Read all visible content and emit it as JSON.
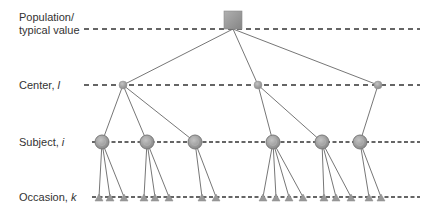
{
  "levels": [
    {
      "id": "population",
      "label": "Population/\ntypical value",
      "y": 29
    },
    {
      "id": "center",
      "label": "Center, l",
      "label_main": "Center, ",
      "label_var": "l",
      "y": 85
    },
    {
      "id": "subject",
      "label": "Subject, i",
      "label_main": "Subject, ",
      "label_var": "i",
      "y": 142
    },
    {
      "id": "occasion",
      "label": "Occasion, k",
      "label_main": "Occasion, ",
      "label_var": "k",
      "y": 197
    }
  ],
  "colors": {
    "node_fill": "#9a9a9a",
    "node_stroke": "#7a7a7a",
    "edge": "#666666",
    "dash": "#333333",
    "text": "#333333"
  },
  "tree": {
    "population": {
      "x": 233,
      "y": 20
    },
    "centers": [
      {
        "x": 123,
        "y": 85,
        "subjects": [
          {
            "x": 102,
            "occasions": [
              99,
              110,
              124
            ]
          },
          {
            "x": 147,
            "occasions": [
              144,
              155,
              169
            ]
          },
          {
            "x": 195,
            "occasions": [
              202,
              216
            ]
          }
        ]
      },
      {
        "x": 258,
        "y": 85,
        "subjects": [
          {
            "x": 273,
            "occasions": [
              263,
              276,
              289,
              303
            ]
          },
          {
            "x": 322,
            "occasions": [
              324,
              336,
              351
            ]
          }
        ]
      },
      {
        "x": 378,
        "y": 85,
        "subjects": [
          {
            "x": 360,
            "occasions": [
              369,
              381
            ]
          }
        ]
      }
    ]
  }
}
